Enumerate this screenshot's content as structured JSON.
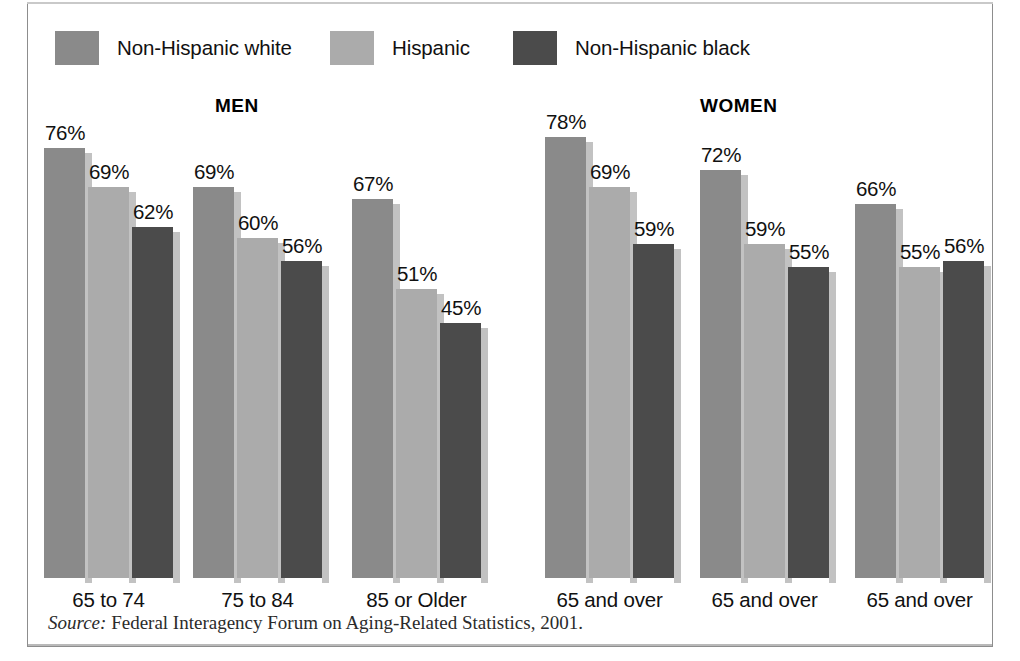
{
  "figure": {
    "width": 1020,
    "height": 661,
    "background": "#ffffff",
    "border_color": "#8d8d8d"
  },
  "legend": {
    "entries": [
      {
        "label": "Non-Hispanic white",
        "color": "#8a8a8a",
        "swatch_name": "legend-swatch-non-hispanic-white"
      },
      {
        "label": "Hispanic",
        "color": "#ababab",
        "swatch_name": "legend-swatch-hispanic"
      },
      {
        "label": "Non-Hispanic black",
        "color": "#4b4b4b",
        "swatch_name": "legend-swatch-non-hispanic-black"
      }
    ]
  },
  "panels": [
    {
      "title": "MEN"
    },
    {
      "title": "WOMEN"
    }
  ],
  "source": {
    "prefix": "Source:",
    "text": "Federal Interagency Forum on Aging-Related Statistics, 2001."
  },
  "chart_data": {
    "type": "bar",
    "title": "",
    "subtitle": "",
    "xlabel": "",
    "ylabel": "",
    "ylim": [
      0,
      80
    ],
    "grid": false,
    "legend_position": "top",
    "value_suffix": "%",
    "panels": [
      {
        "name": "MEN",
        "categories": [
          "65 to 74",
          "75 to 84",
          "85 or Older"
        ],
        "series": [
          {
            "name": "Non-Hispanic white",
            "color": "#8a8a8a",
            "values": [
              76,
              69,
              67
            ]
          },
          {
            "name": "Hispanic",
            "color": "#ababab",
            "values": [
              69,
              60,
              51
            ]
          },
          {
            "name": "Non-Hispanic black",
            "color": "#4b4b4b",
            "values": [
              62,
              56,
              45
            ]
          }
        ]
      },
      {
        "name": "WOMEN",
        "categories": [
          "65 and over",
          "65 and over",
          "65 and over"
        ],
        "series": [
          {
            "name": "Non-Hispanic white",
            "color": "#8a8a8a",
            "values": [
              78,
              72,
              66
            ]
          },
          {
            "name": "Hispanic",
            "color": "#ababab",
            "values": [
              69,
              59,
              55
            ]
          },
          {
            "name": "Non-Hispanic black",
            "color": "#4b4b4b",
            "values": [
              59,
              55,
              56
            ]
          }
        ]
      }
    ]
  },
  "layout": {
    "baseline_y": 578,
    "px_per_percent": 5.66,
    "bar_width": 41,
    "bar_gap": 3,
    "shadow_width": 7,
    "shadow_offset_y": 5,
    "group_x": [
      44,
      193,
      352,
      545,
      700,
      855
    ],
    "legend_x": [
      55,
      330,
      513
    ],
    "panel_title_x": [
      215,
      700
    ],
    "panel_title_y": 95,
    "group_label_y": 588
  }
}
